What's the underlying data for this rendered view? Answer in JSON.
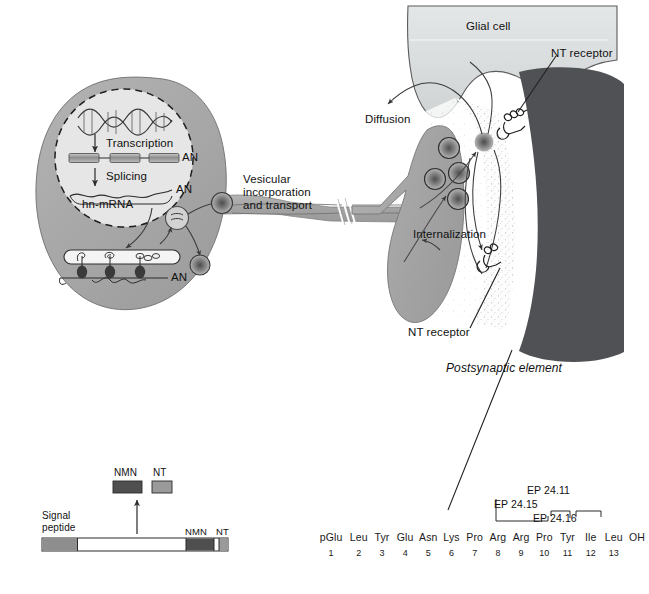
{
  "figure": {
    "colors": {
      "soma_fill": "#a8a8a8",
      "nucleus_fill": "#e2e2e2",
      "terminal_fill": "#a8a8a8",
      "glial_fill": "#d9dcdc",
      "postsynaptic_fill": "#4f5154",
      "cleft_fill": "#fbfbfb",
      "vesicle_core": "#6a6a6a",
      "line": "#2b2b2b",
      "nmn_block": "#555555",
      "nt_block": "#9a9a9a",
      "signal_block": "#8a8a8a",
      "precursor_body": "#ffffff"
    }
  },
  "labels": {
    "transcription": "Transcription",
    "splicing": "Splicing",
    "hn_mrna": "hn-mRNA",
    "an_pre_mrna": "AN",
    "an_spliced": "AN",
    "an_ribosome": "AN",
    "vesicular_transport": "Vesicular incorporation and transport",
    "vesicular_transport_line1": "Vesicular incorporation",
    "vesicular_transport_line2": "and transport",
    "diffusion": "Diffusion",
    "internalization": "Internalization",
    "glial_cell": "Glial cell",
    "nt_receptor_top": "NT receptor",
    "nt_receptor_bottom": "NT receptor",
    "postsynaptic_element": "Postsynaptic element"
  },
  "legend": {
    "signal_peptide_line1": "Signal",
    "signal_peptide_line2": "peptide",
    "nmn_label_top": "NMN",
    "nt_label_top": "NT",
    "nmn_label_bar": "NMN",
    "nt_label_bar": "NT"
  },
  "peptide": {
    "residues": [
      "pGlu",
      "Leu",
      "Tyr",
      "Glu",
      "Asn",
      "Lys",
      "Pro",
      "Arg",
      "Arg",
      "Pro",
      "Tyr",
      "Ile",
      "Leu"
    ],
    "c_terminus": "OH",
    "numbers": [
      "1",
      "2",
      "3",
      "4",
      "5",
      "6",
      "7",
      "8",
      "9",
      "10",
      "11",
      "12",
      "13"
    ],
    "enzymes": [
      {
        "name": "EP 24.15",
        "cleaves_after_residue": 10
      },
      {
        "name": "EP 24.16",
        "cleaves_after_residue": 11
      },
      {
        "name": "EP 24.11",
        "cleaves_after_residue": 12
      }
    ],
    "enzyme_24_15": "EP 24.15",
    "enzyme_24_16": "EP 24.16",
    "enzyme_24_11": "EP 24.11"
  }
}
